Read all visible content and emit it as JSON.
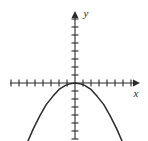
{
  "figure": {
    "name": "coordinate-plane-parabola",
    "background_color": "#ffffff",
    "ink_color": "#2b2b2b",
    "width": 148,
    "height": 141
  },
  "axes": {
    "x_label": "x",
    "y_label": "y",
    "origin_px": {
      "x": 75,
      "y": 83
    },
    "tick_spacing_px": 8,
    "x_axis": {
      "start_px": 10,
      "end_px": 137,
      "arrow": "right",
      "tick_count": 15,
      "tick_half_length_px": 3.5
    },
    "y_axis": {
      "start_px": 12,
      "end_px": 139,
      "arrow": "up",
      "tick_count": 15,
      "tick_half_length_px": 3.5
    }
  },
  "chart_data": {
    "type": "line",
    "title": "",
    "subtitle": "",
    "xlabel": "x",
    "ylabel": "y",
    "grid": false,
    "legend": "none",
    "curve_name": "downward-opening parabola",
    "equation": "y = -a x^2, a > 0",
    "vertex": {
      "x": 0,
      "y": 0
    },
    "opens": "down",
    "axis_units_visible": {
      "x_left": 8,
      "x_right": 7,
      "y_up": 8,
      "y_down": 7
    },
    "xlim": [
      -8.1,
      7.8
    ],
    "ylim": [
      -7.3,
      8.9
    ],
    "x": [
      -5.9,
      -5.2,
      -4.4,
      -3.6,
      -2.8,
      -2.0,
      -1.2,
      -0.6,
      0.0,
      0.6,
      1.2,
      2.0,
      2.8,
      3.6,
      4.4,
      5.2,
      5.9
    ],
    "values": [
      -7.3,
      -5.7,
      -4.1,
      -2.7,
      -1.7,
      -0.8,
      -0.3,
      -0.08,
      0.0,
      -0.08,
      -0.3,
      -0.8,
      -1.7,
      -2.7,
      -4.1,
      -5.7,
      -7.3
    ],
    "series": [
      {
        "name": "parabola",
        "x": [
          -5.9,
          -5.2,
          -4.4,
          -3.6,
          -2.8,
          -2.0,
          -1.2,
          -0.6,
          0.0,
          0.6,
          1.2,
          2.0,
          2.8,
          3.6,
          4.4,
          5.2,
          5.9
        ],
        "values": [
          -7.3,
          -5.7,
          -4.1,
          -2.7,
          -1.7,
          -0.8,
          -0.3,
          -0.08,
          0.0,
          -0.08,
          -0.3,
          -0.8,
          -1.7,
          -2.7,
          -4.1,
          -5.7,
          -7.3
        ]
      }
    ]
  }
}
